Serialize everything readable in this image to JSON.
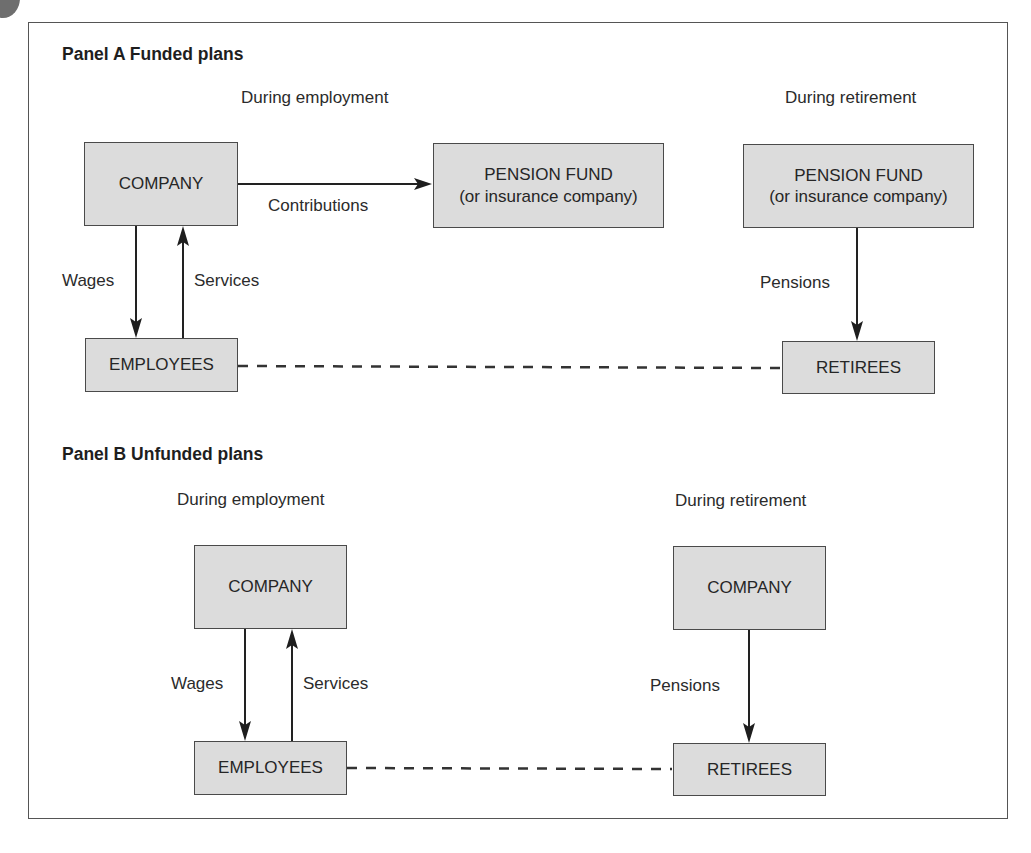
{
  "colors": {
    "box_fill": "#dcdcdc",
    "box_border": "#4a4a4a",
    "line": "#222222",
    "text": "#2a2a2a"
  },
  "panel_a": {
    "title": "Panel A  Funded plans",
    "employment_heading": "During employment",
    "retirement_heading": "During retirement",
    "boxes": {
      "company": "COMPANY",
      "pension_fund_left": {
        "line1": "PENSION FUND",
        "line2": "(or insurance company)"
      },
      "pension_fund_right": {
        "line1": "PENSION FUND",
        "line2": "(or insurance company)"
      },
      "employees": "EMPLOYEES",
      "retirees": "RETIREES"
    },
    "arrows": {
      "contributions": "Contributions",
      "wages": "Wages",
      "services": "Services",
      "pensions": "Pensions"
    }
  },
  "panel_b": {
    "title": "Panel B  Unfunded plans",
    "employment_heading": "During employment",
    "retirement_heading": "During retirement",
    "boxes": {
      "company_left": "COMPANY",
      "company_right": "COMPANY",
      "employees": "EMPLOYEES",
      "retirees": "RETIREES"
    },
    "arrows": {
      "wages": "Wages",
      "services": "Services",
      "pensions": "Pensions"
    }
  }
}
